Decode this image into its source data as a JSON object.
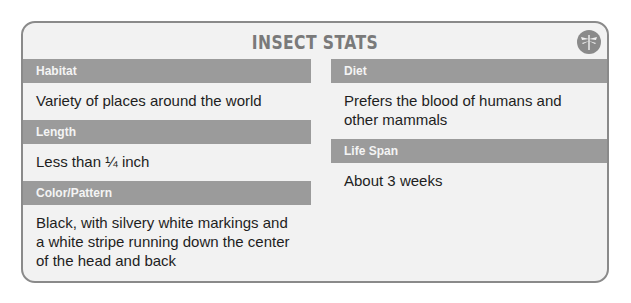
{
  "card": {
    "title": "INSECT STATS",
    "badge_icon": "dragonfly-icon",
    "left": [
      {
        "label": "Habitat",
        "value": "Variety of places around the world"
      },
      {
        "label": "Length",
        "value": "Less than ¼ inch"
      },
      {
        "label": "Color/Pattern",
        "value": "Black, with silvery white markings and a white stripe running down the center of the head and back"
      }
    ],
    "right": [
      {
        "label": "Diet",
        "value": "Prefers the blood of humans and other mammals"
      },
      {
        "label": "Life Span",
        "value": "About 3 weeks"
      }
    ]
  },
  "colors": {
    "border": "#8a8a8a",
    "header_bar": "#9b9b9b",
    "background": "#f2f2f2"
  }
}
